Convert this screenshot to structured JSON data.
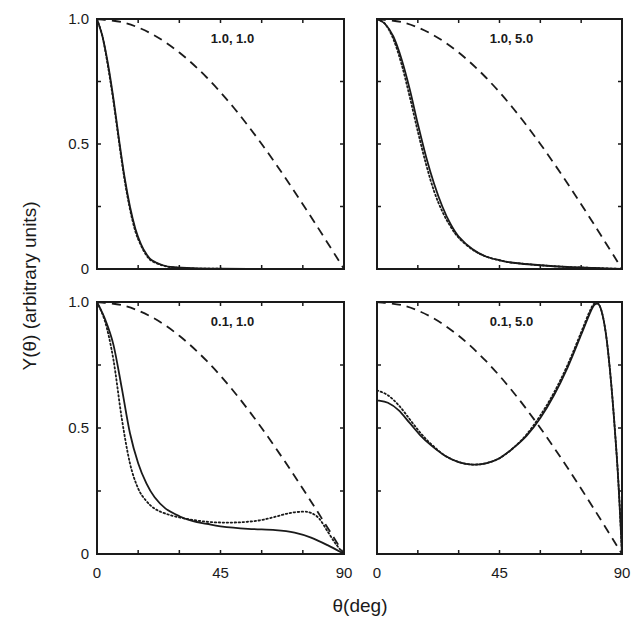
{
  "chart_data": {
    "type": "line",
    "layout": "2x2 grid of panels, shared axes",
    "xlabel": "θ(deg)",
    "ylabel": "Y(θ) (arbitrary units)",
    "xlim": [
      0,
      90
    ],
    "ylim": [
      0,
      1
    ],
    "x_ticks": [
      0,
      45,
      90
    ],
    "x_minor_ticks": [
      15,
      30,
      60,
      75
    ],
    "y_ticks": [
      0,
      0.5,
      1.0
    ],
    "y_tick_labels": [
      "0",
      "0.5",
      "1.0"
    ],
    "y_minor_ticks": [
      0.25,
      0.75
    ],
    "x_tick_labels": [
      "0",
      "45",
      "90"
    ],
    "grid": false,
    "legend": null,
    "series_styles": {
      "solid": {
        "dash": "none",
        "width": 1.8
      },
      "dotted": {
        "dash": "1.5,2.5",
        "width": 1.8
      },
      "dashed": {
        "dash": "9,6",
        "width": 1.8
      }
    },
    "panels": [
      {
        "id": "top-left",
        "label": "1.0, 1.0",
        "series": [
          {
            "name": "solid",
            "x": [
              0,
              2,
              4,
              6,
              8,
              10,
              12,
              14,
              16,
              18,
              20,
              24,
              28,
              35,
              45,
              60,
              75,
              90
            ],
            "y": [
              1.0,
              0.93,
              0.82,
              0.68,
              0.52,
              0.37,
              0.25,
              0.16,
              0.1,
              0.06,
              0.035,
              0.015,
              0.007,
              0.003,
              0.001,
              0,
              0,
              0
            ]
          },
          {
            "name": "dotted",
            "x": [
              0,
              2,
              4,
              6,
              8,
              10,
              12,
              14,
              16,
              18,
              20,
              24,
              28,
              35,
              45,
              60,
              75,
              90
            ],
            "y": [
              1.0,
              0.93,
              0.81,
              0.67,
              0.51,
              0.36,
              0.24,
              0.15,
              0.095,
              0.055,
              0.032,
              0.014,
              0.006,
              0.002,
              0.001,
              0,
              0,
              0
            ]
          },
          {
            "name": "dashed",
            "x": [
              0,
              10,
              20,
              30,
              40,
              50,
              60,
              70,
              80,
              90
            ],
            "y": [
              1.0,
              0.985,
              0.94,
              0.866,
              0.766,
              0.643,
              0.5,
              0.342,
              0.174,
              0.0
            ]
          }
        ]
      },
      {
        "id": "top-right",
        "label": "1.0, 5.0",
        "series": [
          {
            "name": "solid",
            "x": [
              0,
              3,
              6,
              9,
              12,
              15,
              18,
              21,
              24,
              27,
              30,
              35,
              40,
              45,
              50,
              60,
              70,
              80,
              90
            ],
            "y": [
              1.0,
              0.98,
              0.93,
              0.84,
              0.72,
              0.58,
              0.45,
              0.34,
              0.25,
              0.18,
              0.13,
              0.08,
              0.05,
              0.035,
              0.025,
              0.015,
              0.008,
              0.004,
              0.0
            ]
          },
          {
            "name": "dotted",
            "x": [
              0,
              3,
              6,
              9,
              12,
              15,
              18,
              21,
              24,
              27,
              30,
              35,
              40,
              45,
              50,
              60,
              70,
              80,
              90
            ],
            "y": [
              1.0,
              0.98,
              0.92,
              0.82,
              0.69,
              0.55,
              0.42,
              0.31,
              0.23,
              0.17,
              0.125,
              0.078,
              0.05,
              0.035,
              0.025,
              0.015,
              0.008,
              0.004,
              0.0
            ]
          },
          {
            "name": "dashed",
            "x": [
              0,
              10,
              20,
              30,
              40,
              50,
              60,
              70,
              80,
              90
            ],
            "y": [
              1.0,
              0.985,
              0.94,
              0.866,
              0.766,
              0.643,
              0.5,
              0.342,
              0.174,
              0.0
            ]
          }
        ]
      },
      {
        "id": "bottom-left",
        "label": "0.1, 1.0",
        "series": [
          {
            "name": "solid",
            "x": [
              0,
              3,
              6,
              9,
              12,
              15,
              18,
              21,
              25,
              30,
              35,
              40,
              45,
              55,
              65,
              72,
              78,
              84,
              90
            ],
            "y": [
              1.0,
              0.93,
              0.83,
              0.66,
              0.48,
              0.36,
              0.28,
              0.225,
              0.18,
              0.15,
              0.13,
              0.12,
              0.11,
              0.1,
              0.095,
              0.085,
              0.065,
              0.035,
              0.0
            ]
          },
          {
            "name": "dotted",
            "x": [
              0,
              3,
              6,
              9,
              12,
              15,
              18,
              21,
              25,
              30,
              35,
              40,
              45,
              50,
              55,
              60,
              65,
              70,
              75,
              78,
              81,
              84,
              87,
              90
            ],
            "y": [
              1.0,
              0.92,
              0.77,
              0.54,
              0.36,
              0.26,
              0.21,
              0.18,
              0.16,
              0.145,
              0.135,
              0.128,
              0.125,
              0.125,
              0.128,
              0.135,
              0.148,
              0.162,
              0.168,
              0.163,
              0.14,
              0.09,
              0.04,
              0.0
            ]
          },
          {
            "name": "dashed",
            "x": [
              0,
              10,
              20,
              30,
              40,
              50,
              60,
              70,
              80,
              90
            ],
            "y": [
              1.0,
              0.985,
              0.94,
              0.866,
              0.766,
              0.643,
              0.5,
              0.342,
              0.174,
              0.0
            ]
          }
        ]
      },
      {
        "id": "bottom-right",
        "label": "0.1, 5.0",
        "series": [
          {
            "name": "solid",
            "x": [
              0,
              4,
              8,
              12,
              16,
              20,
              25,
              30,
              35,
              40,
              45,
              50,
              55,
              60,
              65,
              70,
              75,
              78,
              80,
              82,
              84,
              86,
              88,
              89,
              90
            ],
            "y": [
              0.61,
              0.6,
              0.57,
              0.52,
              0.47,
              0.43,
              0.39,
              0.365,
              0.355,
              0.36,
              0.38,
              0.42,
              0.47,
              0.54,
              0.63,
              0.74,
              0.87,
              0.95,
              0.99,
              0.98,
              0.88,
              0.68,
              0.4,
              0.22,
              0.0
            ]
          },
          {
            "name": "dotted",
            "x": [
              0,
              4,
              8,
              12,
              16,
              20,
              25,
              30,
              35,
              40,
              45,
              50,
              55,
              60,
              65,
              70,
              75,
              78,
              80,
              82,
              84,
              86,
              88,
              89,
              90
            ],
            "y": [
              0.65,
              0.63,
              0.59,
              0.535,
              0.48,
              0.435,
              0.39,
              0.365,
              0.355,
              0.36,
              0.38,
              0.42,
              0.475,
              0.55,
              0.64,
              0.75,
              0.88,
              0.96,
              0.995,
              0.98,
              0.88,
              0.68,
              0.4,
              0.22,
              0.0
            ]
          },
          {
            "name": "dashed",
            "x": [
              0,
              10,
              20,
              30,
              40,
              50,
              60,
              70,
              80,
              90
            ],
            "y": [
              1.0,
              0.985,
              0.94,
              0.866,
              0.766,
              0.643,
              0.5,
              0.342,
              0.174,
              0.0
            ]
          }
        ]
      }
    ]
  },
  "figure": {
    "xlabel": "θ(deg)",
    "ylabel": "Y(θ) (arbitrary units)",
    "panels_geometry": [
      {
        "x0": 97,
        "y0": 19,
        "x1": 344,
        "y1": 269
      },
      {
        "x0": 377,
        "y0": 19,
        "x1": 622,
        "y1": 269
      },
      {
        "x0": 97,
        "y0": 302,
        "x1": 344,
        "y1": 554
      },
      {
        "x0": 377,
        "y0": 302,
        "x1": 622,
        "y1": 554
      }
    ],
    "colors": {
      "ink": "#1a1a1a",
      "background": "#ffffff"
    }
  }
}
